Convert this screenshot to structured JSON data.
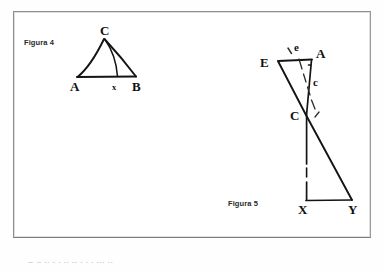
{
  "page": {
    "background_color": "#ffffff",
    "frame_color": "#8e8e8e",
    "ink_color": "#111111"
  },
  "figures": [
    {
      "id": "figura-4",
      "caption": "Figura 4",
      "description": "Triangle ABC with a cevian drawn from apex C to point x on base AB",
      "vertex_labels": [
        "C",
        "A",
        "x",
        "B"
      ],
      "labels": {
        "apex": "C",
        "base_left": "A",
        "base_point": "x",
        "base_right": "B"
      }
    },
    {
      "id": "figura-5",
      "caption": "Figura 5",
      "description": "Quadrilateral figure: E at upper left joined to A at upper right; segment E-C-Y descends to the right; vertical segment A-C-X descends to X; base X-Y closes the figure. Angles e and c are marked near the top with dashed arcs.",
      "vertex_labels": [
        "E",
        "A",
        "C",
        "X",
        "Y"
      ],
      "angle_labels": [
        "e",
        "c"
      ],
      "labels": {
        "upper_left": "E",
        "upper_right": "A",
        "middle": "C",
        "lower_left": "X",
        "lower_right": "Y",
        "angle_top": "e",
        "angle_lower": "c"
      }
    }
  ],
  "bottom_cut_text": "a  u  ..  t  .  ..   n  .  .   .  ...  .."
}
